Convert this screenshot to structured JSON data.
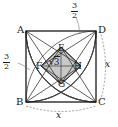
{
  "figure": {
    "type": "geometry-diagram",
    "background_color": "#ffffff",
    "stroke_color": "#1a1a1a",
    "shade_color": "#c9c9c9",
    "arc_color": "#555555",
    "dimension_color": "#777777",
    "vertices": [
      {
        "id": "A",
        "label": "A",
        "x": 19,
        "y": 25,
        "corner": "top-left"
      },
      {
        "id": "D",
        "label": "D",
        "x": 99,
        "y": 25,
        "corner": "top-right"
      },
      {
        "id": "B",
        "label": "B",
        "x": 17,
        "y": 98,
        "corner": "bottom-left"
      },
      {
        "id": "C",
        "label": "C",
        "x": 99,
        "y": 98,
        "corner": "bottom-right"
      }
    ],
    "inner_vertices": [
      {
        "id": "E",
        "label": "E",
        "x": 58,
        "y": 45
      },
      {
        "id": "F",
        "label": "F",
        "x": 37,
        "y": 64
      },
      {
        "id": "H",
        "label": "H",
        "x": 74,
        "y": 64
      },
      {
        "id": "G",
        "label": "G",
        "x": 58,
        "y": 81
      }
    ],
    "measurements": [
      {
        "id": "top-three-halves",
        "numerator": "3",
        "denominator": "2",
        "x": 74,
        "y": 3,
        "anchor": "top-edge"
      },
      {
        "id": "left-three-halves",
        "numerator": "3",
        "denominator": "2",
        "x": 3,
        "y": 57,
        "anchor": "left-edge"
      },
      {
        "id": "rhombus-side",
        "text": "√3",
        "radicand": "3",
        "x": 50,
        "y": 59,
        "anchor": "rhombus-diagonal"
      },
      {
        "id": "right-side-x",
        "text": "x",
        "x": 105,
        "y": 64,
        "anchor": "right-dimension"
      },
      {
        "id": "bottom-side-x",
        "text": "x",
        "x": 58,
        "y": 113,
        "anchor": "bottom-dimension"
      }
    ],
    "square": {
      "left": 26,
      "top": 31,
      "right": 96,
      "bottom": 102
    },
    "arcs": [
      {
        "center": "A",
        "note": "quarter circle centered at A"
      },
      {
        "center": "B",
        "note": "quarter circle centered at B"
      },
      {
        "center": "C",
        "note": "quarter circle centered at C"
      },
      {
        "center": "D",
        "note": "quarter circle centered at D"
      }
    ],
    "dimension_lines": [
      {
        "id": "bottom-x-arc",
        "from": "B",
        "to": "C",
        "style": "dashed",
        "label": "x"
      },
      {
        "id": "right-x-arc",
        "from": "D",
        "to": "C",
        "style": "dashed",
        "label": "x"
      }
    ]
  }
}
